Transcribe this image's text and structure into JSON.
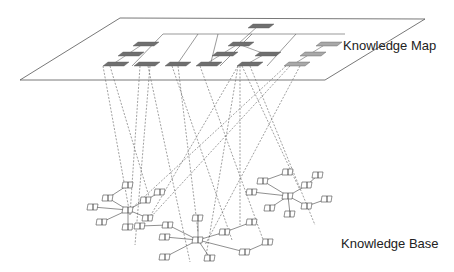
{
  "labels": {
    "map": "Knowledge Map",
    "base": "Knowledge Base"
  },
  "colors": {
    "plane_stroke": "#555555",
    "node_dark": "#6f6f6f",
    "node_light": "#a8a8a8",
    "link": "#777777",
    "book_stroke": "#444444"
  },
  "map_nodes": [
    {
      "id": "top",
      "shade": "dark"
    },
    {
      "id": "a1",
      "shade": "dark"
    },
    {
      "id": "a2",
      "shade": "dark"
    },
    {
      "id": "a3",
      "shade": "dark"
    },
    {
      "id": "a4",
      "shade": "dark"
    },
    {
      "id": "b1",
      "shade": "dark"
    },
    {
      "id": "b2",
      "shade": "dark"
    },
    {
      "id": "b3",
      "shade": "dark"
    },
    {
      "id": "b4",
      "shade": "dark"
    },
    {
      "id": "b5",
      "shade": "dark"
    },
    {
      "id": "b6",
      "shade": "dark"
    },
    {
      "id": "c1",
      "shade": "light"
    },
    {
      "id": "c2",
      "shade": "light"
    },
    {
      "id": "c3",
      "shade": "light"
    }
  ],
  "knowledge_base_clusters": [
    {
      "id": "left-cluster",
      "documents": 11
    },
    {
      "id": "center-cluster",
      "documents": 11
    },
    {
      "id": "right-cluster",
      "documents": 10
    }
  ]
}
